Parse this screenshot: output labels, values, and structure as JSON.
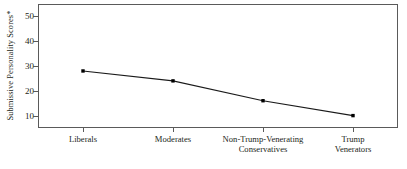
{
  "chart_data": {
    "type": "line",
    "title": "",
    "subtitle": "",
    "xlabel": "",
    "ylabel": "Submissive Personality Scores*",
    "categories": [
      "Liberals",
      "Moderates",
      "Non-Trump-Venerating Conservatives",
      "Trump Venerators"
    ],
    "category_lines": [
      [
        "Liberals"
      ],
      [
        "Moderates"
      ],
      [
        "Non-Trump-Venerating",
        "Conservatives"
      ],
      [
        "Trump",
        "Venerators"
      ]
    ],
    "values": [
      28,
      24,
      16,
      10
    ],
    "ylim": [
      5,
      55
    ],
    "yticks": [
      10,
      20,
      30,
      40,
      50
    ],
    "ytick_labels": [
      "10",
      "20",
      "30",
      "40",
      "50"
    ],
    "grid": false,
    "legend": false,
    "legend_position": "none",
    "marker": "square",
    "line_color": "#1a1a1a",
    "marker_color": "#000000",
    "frame_color": "#5a5a5a",
    "background_color": "#ffffff",
    "text_color": "#231f20",
    "footnote_marker": "*"
  }
}
